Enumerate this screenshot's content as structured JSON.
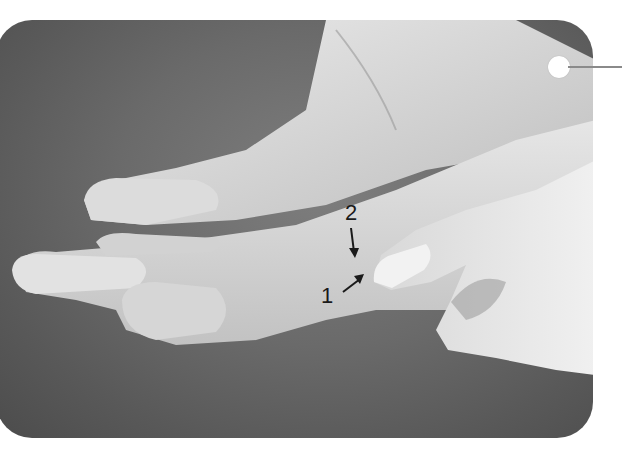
{
  "figure": {
    "colors": {
      "background": "#ffffff",
      "photo_backdrop": "#6a6a6a",
      "skin_light": "#e4e4e4",
      "skin_mid": "#c8c8c8",
      "label_text": "#1a1a1a",
      "marker_dot": "#ffffff",
      "marker_line": "#8a8a8a"
    },
    "callouts": [
      {
        "id": "2",
        "label": "2",
        "arrow": "arrow-down"
      },
      {
        "id": "1",
        "label": "1",
        "arrow": "arrow-up-right"
      }
    ],
    "corner_marker": {
      "shape": "circle-with-leader-line"
    }
  }
}
